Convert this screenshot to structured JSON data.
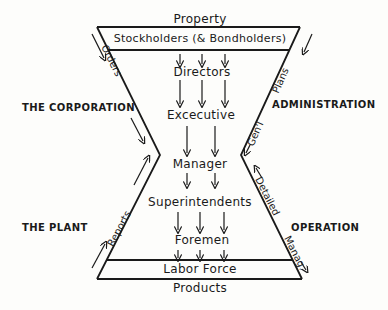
{
  "diagram": {
    "top_label": "Property",
    "top_band": "Stockholders (& Bondholders)",
    "levels": [
      "Directors",
      "Excecutive",
      "Manager",
      "Superintendents",
      "Foremen"
    ],
    "bottom_band": "Labor Force",
    "bottom_label": "Products",
    "left_side": {
      "upper_label": "THE CORPORATION",
      "lower_label": "THE PLANT",
      "upper_flow": "Orders",
      "lower_flow": "Reports"
    },
    "right_side": {
      "upper_label": "ADMINISTRATION",
      "lower_label": "OPERATION",
      "upper_flow_1": "Plans",
      "upper_flow_2": "Gen'l",
      "lower_flow_1": "Detailed",
      "lower_flow_2": "Manag."
    },
    "colors": {
      "ink": "#1a1a1a",
      "paper": "#fdfdfb"
    }
  }
}
